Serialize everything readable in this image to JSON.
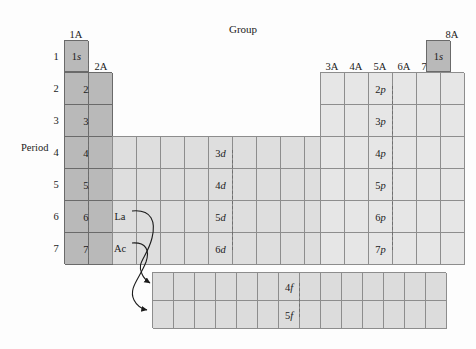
{
  "figure": {
    "group_title": "Group",
    "period_title": "Period"
  },
  "group_headers": [
    {
      "label": "1A",
      "x": 76,
      "y": 30
    },
    {
      "label": "2A",
      "x": 101,
      "y": 62
    },
    {
      "label": "3A",
      "x": 332,
      "y": 62
    },
    {
      "label": "4A",
      "x": 356,
      "y": 62
    },
    {
      "label": "5A",
      "x": 380,
      "y": 62
    },
    {
      "label": "6A",
      "x": 404,
      "y": 62
    },
    {
      "label": "7A",
      "x": 428,
      "y": 62
    },
    {
      "label": "8A",
      "x": 452,
      "y": 30
    }
  ],
  "period_numbers": [
    {
      "label": "1",
      "y": 52
    },
    {
      "label": "2",
      "y": 84
    },
    {
      "label": "3",
      "y": 116
    },
    {
      "label": "4",
      "y": 148
    },
    {
      "label": "5",
      "y": 180
    },
    {
      "label": "6",
      "y": 212
    },
    {
      "label": "7",
      "y": 244
    }
  ],
  "s_block": {
    "rows": [
      {
        "orbital_n": "1",
        "orbital_l": "s",
        "cols": 1
      },
      {
        "orbital_n": "2",
        "orbital_l": "s",
        "cols": 2
      },
      {
        "orbital_n": "3",
        "orbital_l": "s",
        "cols": 2
      },
      {
        "orbital_n": "4",
        "orbital_l": "s",
        "cols": 2
      },
      {
        "orbital_n": "5",
        "orbital_l": "s",
        "cols": 2
      },
      {
        "orbital_n": "6",
        "orbital_l": "s",
        "cols": 2
      },
      {
        "orbital_n": "7",
        "orbital_l": "s",
        "cols": 2
      }
    ]
  },
  "helium_cell": {
    "orbital_n": "1",
    "orbital_l": "s",
    "group": "8A"
  },
  "d_block": {
    "columns": 10,
    "rows": [
      {
        "orbital_n": "3",
        "orbital_l": "d",
        "period": "4"
      },
      {
        "orbital_n": "4",
        "orbital_l": "d",
        "period": "5"
      },
      {
        "orbital_n": "5",
        "orbital_l": "d",
        "period": "6"
      },
      {
        "orbital_n": "6",
        "orbital_l": "d",
        "period": "7"
      }
    ]
  },
  "p_block": {
    "columns": 6,
    "rows": [
      {
        "orbital_n": "2",
        "orbital_l": "p",
        "period": "2"
      },
      {
        "orbital_n": "3",
        "orbital_l": "p",
        "period": "3"
      },
      {
        "orbital_n": "4",
        "orbital_l": "p",
        "period": "4"
      },
      {
        "orbital_n": "5",
        "orbital_l": "p",
        "period": "5"
      },
      {
        "orbital_n": "6",
        "orbital_l": "p",
        "period": "6"
      },
      {
        "orbital_n": "7",
        "orbital_l": "p",
        "period": "7"
      }
    ]
  },
  "f_block": {
    "columns": 14,
    "rows": [
      {
        "orbital_n": "4",
        "orbital_l": "f"
      },
      {
        "orbital_n": "5",
        "orbital_l": "f"
      }
    ]
  },
  "series_markers": [
    {
      "label": "La",
      "x": 120,
      "y": 212
    },
    {
      "label": "Ac",
      "x": 120,
      "y": 244
    }
  ],
  "colors": {
    "s_block_fill": "#b9b9b9",
    "d_block_fill": "#dedede",
    "p_block_fill": "#e6e6e6",
    "f_block_fill": "#dcdcdc",
    "grid_line": "#8d8d8d",
    "outline_dark": "#6a6a6a",
    "text": "#1b1b1b",
    "page_background": "#fdfdfd"
  }
}
